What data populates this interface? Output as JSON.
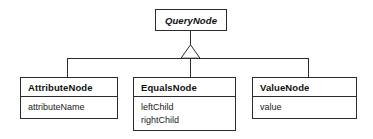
{
  "diagram": {
    "type": "uml-class-diagram",
    "relationship": "generalization",
    "background_color": "#ffffff",
    "line_color": "#2b2b2b",
    "text_color": "#111111"
  },
  "classes": {
    "superclass": {
      "name": "QueryNode",
      "is_abstract": true,
      "attributes": []
    },
    "subclasses": [
      {
        "name": "AttributeNode",
        "is_abstract": false,
        "attributes": [
          "attributeName"
        ]
      },
      {
        "name": "EqualsNode",
        "is_abstract": false,
        "attributes": [
          "leftChild",
          "rightChild"
        ]
      },
      {
        "name": "ValueNode",
        "is_abstract": false,
        "attributes": [
          "value"
        ]
      }
    ]
  }
}
